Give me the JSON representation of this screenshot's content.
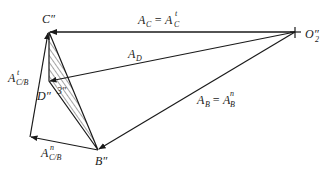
{
  "diagram": {
    "points": {
      "C": {
        "label": "C″",
        "x": 49,
        "y": 32
      },
      "O2": {
        "label": "O′₂",
        "x": 295,
        "y": 32
      },
      "D": {
        "label": "D″",
        "x": 49,
        "y": 81
      },
      "B": {
        "label": "B″",
        "x": 98,
        "y": 150
      },
      "K": {
        "x": 30,
        "y": 137
      }
    },
    "labels": {
      "C": "C″",
      "D": "D″",
      "B": "B″",
      "O2": "O″",
      "O2_sub": "2",
      "link3": "3″",
      "AC_main": "A",
      "AC_sub": "C",
      "AC_eq": "= A",
      "AC_rhs_sub": "C",
      "AC_rhs_sup": "t",
      "AD_main": "A",
      "AD_sub": "D",
      "AB_main": "A",
      "AB_sub": "B",
      "AB_eq": "= A",
      "AB_rhs_sub": "B",
      "AB_rhs_sup": "n",
      "ACBt_main": "A",
      "ACBt_sub": "C/B",
      "ACBt_sup": "t",
      "ACBn_main": "A",
      "ACBn_sub": "C/B",
      "ACBn_sup": "n"
    },
    "vectors": [
      {
        "name": "A_C",
        "from": "O2",
        "to": "C"
      },
      {
        "name": "A_D",
        "from": "O2",
        "to": "D"
      },
      {
        "name": "A_B",
        "from": "O2",
        "to": "B"
      },
      {
        "name": "A_C/B_n",
        "from": "B",
        "to": "K"
      },
      {
        "name": "A_C/B_t",
        "from": "K",
        "to": "C"
      }
    ],
    "colors": {
      "line": "#1a1a1a",
      "background": "#ffffff"
    }
  }
}
